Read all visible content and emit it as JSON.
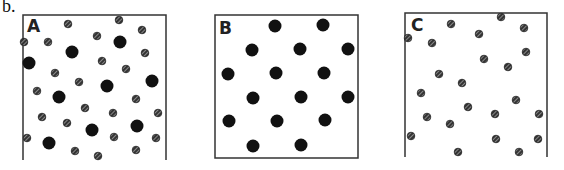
{
  "figure": {
    "label": "b.",
    "colors": {
      "border": "#333333",
      "large_particle": "#111111",
      "small_particle_fill": "#333333",
      "small_particle_hatch": "#dddddd",
      "background": "#ffffff"
    },
    "panels": [
      {
        "id": "A",
        "letter": "A",
        "box": {
          "x": 23,
          "y": 15,
          "w": 143,
          "h": 145,
          "closed_bottom": false
        },
        "letter_pos": {
          "x": 27,
          "y": 18
        },
        "large_particles": [
          [
            120,
            42
          ],
          [
            72,
            52
          ],
          [
            29,
            63
          ],
          [
            107,
            86
          ],
          [
            152,
            81
          ],
          [
            59,
            97
          ],
          [
            92,
            130
          ],
          [
            137,
            126
          ],
          [
            49,
            143
          ]
        ],
        "small_particles": [
          [
            68,
            24
          ],
          [
            97,
            36
          ],
          [
            48,
            42
          ],
          [
            24,
            42
          ],
          [
            102,
            61
          ],
          [
            126,
            69
          ],
          [
            145,
            53
          ],
          [
            55,
            73
          ],
          [
            79,
            82
          ],
          [
            37,
            91
          ],
          [
            136,
            99
          ],
          [
            85,
            108
          ],
          [
            113,
            113
          ],
          [
            42,
            117
          ],
          [
            158,
            113
          ],
          [
            67,
            123
          ],
          [
            27,
            138
          ],
          [
            114,
            137
          ],
          [
            156,
            138
          ],
          [
            75,
            151
          ],
          [
            98,
            156
          ],
          [
            136,
            150
          ],
          [
            119,
            20
          ],
          [
            142,
            30
          ]
        ]
      },
      {
        "id": "B",
        "letter": "B",
        "box": {
          "x": 215,
          "y": 15,
          "w": 143,
          "h": 143,
          "closed_bottom": true
        },
        "letter_pos": {
          "x": 219,
          "y": 20
        },
        "large_particles": [
          [
            275,
            26
          ],
          [
            323,
            25
          ],
          [
            252,
            50
          ],
          [
            300,
            49
          ],
          [
            348,
            49
          ],
          [
            228,
            74
          ],
          [
            276,
            73
          ],
          [
            324,
            73
          ],
          [
            253,
            98
          ],
          [
            301,
            97
          ],
          [
            348,
            97
          ],
          [
            229,
            121
          ],
          [
            277,
            121
          ],
          [
            325,
            120
          ],
          [
            253,
            146
          ],
          [
            301,
            145
          ]
        ],
        "small_particles": []
      },
      {
        "id": "C",
        "letter": "C",
        "box": {
          "x": 405,
          "y": 13,
          "w": 142,
          "h": 144,
          "closed_bottom": false
        },
        "letter_pos": {
          "x": 411,
          "y": 17
        },
        "large_particles": [],
        "small_particles": [
          [
            451,
            24
          ],
          [
            479,
            34
          ],
          [
            501,
            17
          ],
          [
            524,
            28
          ],
          [
            408,
            38
          ],
          [
            432,
            43
          ],
          [
            484,
            59
          ],
          [
            526,
            52
          ],
          [
            508,
            67
          ],
          [
            439,
            74
          ],
          [
            462,
            83
          ],
          [
            421,
            93
          ],
          [
            516,
            100
          ],
          [
            468,
            107
          ],
          [
            495,
            114
          ],
          [
            539,
            114
          ],
          [
            427,
            117
          ],
          [
            450,
            124
          ],
          [
            411,
            136
          ],
          [
            496,
            139
          ],
          [
            538,
            139
          ],
          [
            458,
            152
          ],
          [
            519,
            152
          ]
        ]
      }
    ]
  }
}
